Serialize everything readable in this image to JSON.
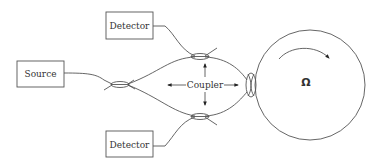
{
  "diagram": {
    "type": "fiber-optic gyroscope schematic",
    "components": {
      "source": {
        "label": "Source"
      },
      "detector_top": {
        "label": "Detector"
      },
      "detector_bottom": {
        "label": "Detector"
      },
      "coupler": {
        "label": "Coupler"
      },
      "fiber_coil": {
        "label": "Ω",
        "rotation_direction": "clockwise"
      }
    },
    "colors": {
      "line": "#555555",
      "text": "#333333",
      "background": "#ffffff"
    }
  }
}
